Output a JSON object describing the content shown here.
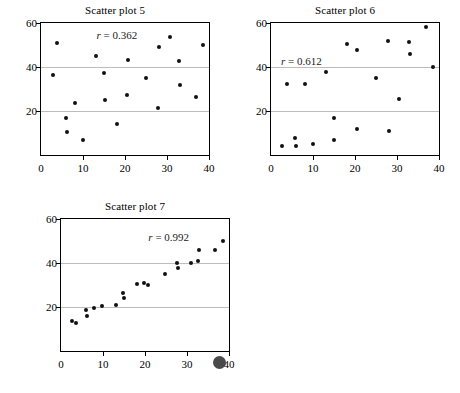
{
  "figure": {
    "background_color": "#ffffff",
    "marker_color": "#111111",
    "gridline_color": "#bdbdbd",
    "axis_color": "#000000",
    "stray_dot_color": "#4a4a4a"
  },
  "axes": {
    "x_ticks": [
      "0",
      "10",
      "20",
      "30",
      "40"
    ],
    "x_tick_values": [
      0,
      10,
      20,
      30,
      40
    ],
    "y_ticks": [
      "20",
      "40",
      "60"
    ],
    "y_tick_values": [
      20,
      40,
      60
    ],
    "origin_label": "0",
    "xlim": [
      0,
      40
    ],
    "ylim": [
      0,
      60
    ],
    "gridline_values": [
      20,
      40
    ]
  },
  "chart_data": [
    {
      "type": "scatter",
      "title": "Scatter plot 5",
      "annotation": "r = 0.362",
      "r_symbol": "r",
      "r_equals": "=",
      "r_value": "0.362",
      "xlabel": "",
      "ylabel": "",
      "xlim": [
        0,
        40
      ],
      "ylim": [
        0,
        60
      ],
      "grid": true,
      "legend": "none",
      "points": [
        [
          2.8,
          36.3
        ],
        [
          3.8,
          50.9
        ],
        [
          5.9,
          16.9
        ],
        [
          6.2,
          10.3
        ],
        [
          8.1,
          23.6
        ],
        [
          10.0,
          6.7
        ],
        [
          13.0,
          45.0
        ],
        [
          15.0,
          37.3
        ],
        [
          15.2,
          25.2
        ],
        [
          18.1,
          14.0
        ],
        [
          20.4,
          27.2
        ],
        [
          20.6,
          43.0
        ],
        [
          24.9,
          34.8
        ],
        [
          27.9,
          21.4
        ],
        [
          28.1,
          49.1
        ],
        [
          30.7,
          53.8
        ],
        [
          32.9,
          42.9
        ],
        [
          33.1,
          32.0
        ],
        [
          36.8,
          26.2
        ],
        [
          38.6,
          50.0
        ]
      ]
    },
    {
      "type": "scatter",
      "title": "Scatter plot 6",
      "annotation": "r = 0.612",
      "r_symbol": "r",
      "r_equals": "=",
      "r_value": "0.612",
      "xlabel": "",
      "ylabel": "",
      "xlim": [
        0,
        40
      ],
      "ylim": [
        0,
        60
      ],
      "grid": true,
      "legend": "none",
      "points": [
        [
          2.5,
          4.0
        ],
        [
          3.8,
          32.3
        ],
        [
          5.8,
          7.9
        ],
        [
          6.0,
          3.9
        ],
        [
          8.2,
          32.3
        ],
        [
          10.0,
          5.0
        ],
        [
          13.1,
          37.8
        ],
        [
          14.9,
          16.6
        ],
        [
          15.1,
          6.8
        ],
        [
          18.0,
          50.3
        ],
        [
          20.4,
          47.8
        ],
        [
          20.5,
          11.8
        ],
        [
          24.9,
          34.9
        ],
        [
          27.8,
          52.0
        ],
        [
          28.0,
          11.0
        ],
        [
          30.4,
          25.3
        ],
        [
          32.8,
          51.2
        ],
        [
          33.0,
          45.9
        ],
        [
          36.9,
          58.1
        ],
        [
          38.6,
          40.1
        ]
      ]
    },
    {
      "type": "scatter",
      "title": "Scatter plot 7",
      "annotation": "r = 0.992",
      "r_symbol": "r",
      "r_equals": "=",
      "r_value": "0.992",
      "xlabel": "",
      "ylabel": "",
      "xlim": [
        0,
        40
      ],
      "ylim": [
        0,
        60
      ],
      "grid": true,
      "legend": "none",
      "points": [
        [
          2.7,
          13.8
        ],
        [
          3.5,
          12.9
        ],
        [
          6.0,
          18.8
        ],
        [
          6.2,
          15.7
        ],
        [
          7.8,
          19.6
        ],
        [
          9.8,
          20.5
        ],
        [
          13.0,
          21.1
        ],
        [
          14.8,
          26.4
        ],
        [
          15.0,
          24.1
        ],
        [
          18.0,
          30.5
        ],
        [
          19.8,
          31.1
        ],
        [
          20.6,
          30.2
        ],
        [
          24.8,
          35.0
        ],
        [
          27.7,
          40.1
        ],
        [
          27.9,
          37.7
        ],
        [
          30.9,
          40.0
        ],
        [
          32.7,
          41.0
        ],
        [
          32.9,
          46.0
        ],
        [
          36.7,
          45.9
        ],
        [
          38.5,
          50.2
        ]
      ]
    }
  ]
}
